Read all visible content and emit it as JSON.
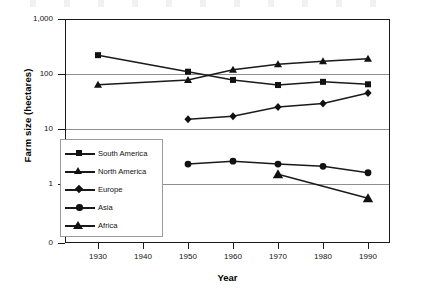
{
  "chart_data": {
    "type": "line",
    "title": "",
    "xlabel": "Year",
    "ylabel": "Farm size (hectares)",
    "xlim": [
      1925,
      1995
    ],
    "ylim": [
      0,
      1000
    ],
    "yscale": "log",
    "grid": "horizontal",
    "legend_position": "inner-left",
    "x": [
      1930,
      1940,
      1950,
      1960,
      1970,
      1980,
      1990
    ],
    "xticklabels": [
      "1930",
      "1940",
      "1950",
      "1960",
      "1970",
      "1980",
      "1990"
    ],
    "yticklabels": [
      "1,000",
      "100",
      "10",
      "1",
      "0"
    ],
    "ytickvalues": [
      1000,
      100,
      10,
      1,
      0
    ],
    "series": [
      {
        "name": "South America",
        "marker": "square",
        "x": [
          1930,
          1950,
          1960,
          1970,
          1980,
          1990
        ],
        "values": [
          220,
          110,
          78,
          63,
          72,
          65
        ]
      },
      {
        "name": "North America",
        "marker": "triangle",
        "x": [
          1930,
          1950,
          1960,
          1970,
          1980,
          1990
        ],
        "values": [
          64,
          78,
          120,
          150,
          170,
          190
        ]
      },
      {
        "name": "Europe",
        "marker": "diamond",
        "x": [
          1950,
          1960,
          1970,
          1980,
          1990
        ],
        "values": [
          15,
          17,
          25,
          29,
          45
        ]
      },
      {
        "name": "Asia",
        "marker": "circle",
        "x": [
          1950,
          1960,
          1970,
          1980,
          1990
        ],
        "values": [
          2.3,
          2.6,
          2.3,
          2.1,
          1.6
        ]
      },
      {
        "name": "Africa",
        "marker": "filled-triangle",
        "x": [
          1970,
          1990
        ],
        "values": [
          1.5,
          0.55
        ]
      }
    ]
  },
  "axes": {
    "y_title": "Farm size (hectares)",
    "x_title": "Year",
    "y_labels": [
      "1,000",
      "100",
      "10",
      "1",
      "0"
    ],
    "x_labels": [
      "1930",
      "1940",
      "1950",
      "1960",
      "1970",
      "1980",
      "1990"
    ]
  },
  "legend": {
    "items": [
      {
        "label": "South America",
        "marker": "square"
      },
      {
        "label": "North America",
        "marker": "triangle"
      },
      {
        "label": "Europe",
        "marker": "diamond"
      },
      {
        "label": "Asia",
        "marker": "circle"
      },
      {
        "label": "Africa",
        "marker": "filled-triangle"
      }
    ]
  },
  "colors": {
    "ink": "#1a1a1a",
    "grid": "#8f8f8f",
    "background": "#ffffff"
  }
}
